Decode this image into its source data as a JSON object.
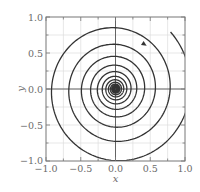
{
  "chart_data": {
    "type": "line",
    "title": "",
    "xlabel": "x",
    "ylabel": "y",
    "xlim": [
      -1.0,
      1.0
    ],
    "ylim": [
      -1.0,
      1.0
    ],
    "grid": true,
    "legend": null,
    "x_ticks": [
      -1.0,
      -0.5,
      0.0,
      0.5,
      1.0
    ],
    "y_ticks": [
      -1.0,
      -0.5,
      0.0,
      0.5,
      1.0
    ],
    "x_tick_labels": [
      "−1.0",
      "−0.5",
      "0.0",
      "0.5",
      "1.0"
    ],
    "y_tick_labels": [
      "−1.0",
      "−0.5",
      "0.0",
      "0.5",
      "1.0"
    ],
    "minor_tick_step": 0.25,
    "series": [
      {
        "name": "trajectory",
        "kind": "logarithmic spiral converging to origin (stable focus)",
        "direction": "clockwise",
        "start_radius": 1.12,
        "start_angle_deg": 45,
        "radius_ratio_per_turn": 0.73,
        "turns": 14,
        "arrow_at": [
          0.4,
          0.63
        ],
        "color": "#333333"
      }
    ],
    "axes_lines_through_origin": true,
    "colors": {
      "curve": "#333333",
      "axis": "#555555",
      "grid": "#dddddd",
      "text": "#6a6a6a"
    }
  },
  "labels": {
    "x_axis": "x",
    "y_axis": "y",
    "x_ticks": [
      "−1.0",
      "−0.5",
      "0.0",
      "0.5",
      "1.0"
    ],
    "y_ticks": [
      "1.0",
      "0.5",
      "0.0",
      "−0.5",
      "−1.0"
    ]
  }
}
